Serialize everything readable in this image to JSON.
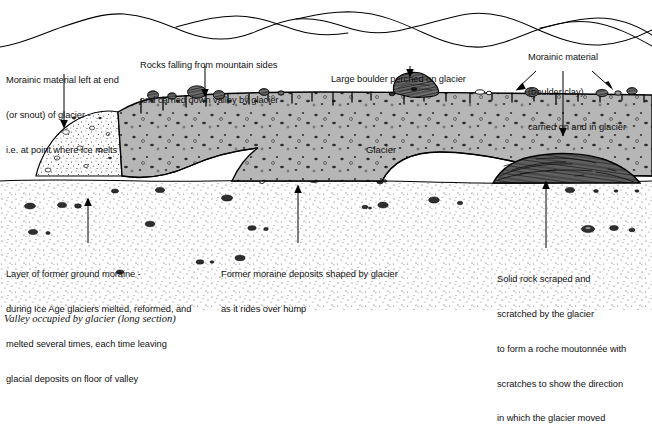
{
  "figure": {
    "caption": "Valley occupied by glacier (long section)",
    "inner_label": "Glacier"
  },
  "annotations": [
    {
      "id": "moraine-snout",
      "lines": [
        "Morainic material left at end",
        "(or snout) of glacier -",
        "i.e. at point where ice melts"
      ]
    },
    {
      "id": "rocks-falling",
      "lines": [
        "Rocks falling from mountain sides",
        "and carried down valley by glacier"
      ]
    },
    {
      "id": "large-boulder",
      "lines": [
        "Large boulder perched on glacier"
      ]
    },
    {
      "id": "boulder-clay",
      "lines": [
        "Morainic material",
        "(boulder clay)",
        "carried on and in glacier"
      ]
    },
    {
      "id": "ground-moraine",
      "lines": [
        "Layer of former ground moraine -",
        "during Ice Age glaciers melted, reformed, and",
        "melted several times, each time leaving",
        "glacial deposits on floor of valley"
      ]
    },
    {
      "id": "former-moraine-hump",
      "lines": [
        "Former moraine deposits shaped by glacier",
        "as it rides over hump"
      ]
    },
    {
      "id": "roche-moutonnee",
      "lines": [
        "Solid rock scraped and",
        "scratched by the glacier",
        "to form a roche moutonnée with",
        "scratches to show the direction",
        "in which the glacier moved"
      ]
    }
  ],
  "colors": {
    "ice": "#b3b3b3",
    "moraine": "#ffffff",
    "rock": "#555555",
    "outline": "#000000",
    "background": "#ffffff"
  }
}
